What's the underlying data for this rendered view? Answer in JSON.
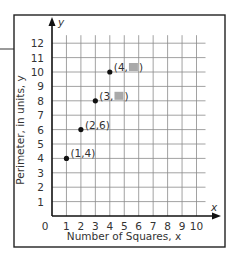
{
  "chart_data": {
    "type": "scatter",
    "title": "",
    "xlabel": "Number of Squares, x",
    "ylabel": "Perimeter, in units, y",
    "x_axis_symbol": "x",
    "y_axis_symbol": "y",
    "origin_label": "0",
    "xlim": [
      0,
      10
    ],
    "ylim": [
      0,
      12
    ],
    "x_ticks": [
      "1",
      "2",
      "3",
      "4",
      "5",
      "6",
      "7",
      "8",
      "9",
      "10"
    ],
    "y_ticks": [
      "1",
      "2",
      "3",
      "4",
      "5",
      "6",
      "7",
      "8",
      "9",
      "10",
      "11",
      "12"
    ],
    "grid": true,
    "legend": null,
    "points": [
      {
        "x": 1,
        "y": 4,
        "label": "(1,4)",
        "hidden_y": false
      },
      {
        "x": 2,
        "y": 6,
        "label": "(2,6)",
        "hidden_y": false
      },
      {
        "x": 3,
        "y": 8,
        "label": "(3,",
        "hidden_y": true
      },
      {
        "x": 4,
        "y": 10,
        "label": "(4,",
        "hidden_y": true
      }
    ],
    "annotation": "y-values for (3, ?) and (4, ?) are covered by gray boxes"
  },
  "colors": {
    "grid": "#8a8a8a",
    "axis": "#111111",
    "frame": "#222222",
    "hidden_box": "#a9a9a9"
  }
}
